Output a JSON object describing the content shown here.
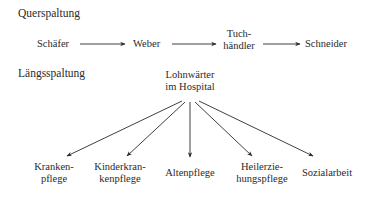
{
  "diagram": {
    "sections": [
      {
        "title": "Querspaltung",
        "type": "horizontal-chain",
        "nodes": [
          {
            "id": "schaefer",
            "label": "Schäfer"
          },
          {
            "id": "weber",
            "label": "Weber"
          },
          {
            "id": "tuchhaendler",
            "label_line1": "Tuch-",
            "label_line2": "händler"
          },
          {
            "id": "schneider",
            "label": "Schneider"
          }
        ],
        "edges": [
          {
            "from": "schaefer",
            "to": "weber"
          },
          {
            "from": "weber",
            "to": "tuchhaendler"
          },
          {
            "from": "tuchhaendler",
            "to": "schneider"
          }
        ]
      },
      {
        "title": "Längsspaltung",
        "type": "fan-out",
        "root": {
          "id": "lohnwaerter",
          "label_line1": "Lohnwärter",
          "label_line2": "im Hospital"
        },
        "children": [
          {
            "id": "krankenpflege",
            "label_line1": "Kranken-",
            "label_line2": "pflege"
          },
          {
            "id": "kinderkrankenpflege",
            "label_line1": "Kinderkran-",
            "label_line2": "kenpflege"
          },
          {
            "id": "altenpflege",
            "label": "Altenpflege"
          },
          {
            "id": "heilerziehungspflege",
            "label_line1": "Heilerzie-",
            "label_line2": "hungspflege"
          },
          {
            "id": "sozialarbeit",
            "label": "Sozialarbeit"
          }
        ]
      }
    ],
    "colors": {
      "line": "#2a2a2a",
      "text": "#2a2a2a",
      "background": "#ffffff"
    }
  }
}
